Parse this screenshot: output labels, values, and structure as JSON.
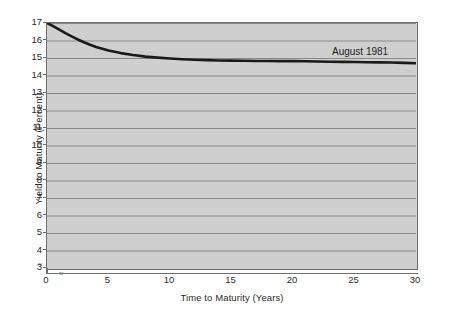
{
  "figure": {
    "background_color": "#ffffff",
    "plot_background_color": "#cfcfcf",
    "gridline_color": "#8a8a8a",
    "frame_color": "#6f6f6f",
    "curve_color": "#1a1a1a"
  },
  "axis_break": {
    "y_break_symbol": "≈",
    "x_break_symbol": "≈"
  },
  "chart_data": {
    "type": "line",
    "title": "",
    "subtitle": "",
    "xlabel": "Time to Maturity (Years)",
    "ylabel": "Yield to Maturity (Percent)",
    "xlim": [
      0,
      30
    ],
    "ylim": [
      3,
      17
    ],
    "y_axis_has_break_below": 3,
    "x_ticks": [
      0,
      5,
      10,
      15,
      20,
      25,
      30
    ],
    "x_tick_labels": [
      "0",
      "5",
      "10",
      "15",
      "20",
      "25",
      "30"
    ],
    "y_ticks": [
      3,
      4,
      5,
      6,
      7,
      8,
      9,
      10,
      11,
      12,
      13,
      14,
      15,
      16,
      17
    ],
    "y_tick_labels": [
      "3",
      "4",
      "5",
      "6",
      "7",
      "8",
      "9",
      "10",
      "11",
      "12",
      "13",
      "14",
      "15",
      "16",
      "17"
    ],
    "grid": true,
    "grid_axis": "y",
    "legend": false,
    "legend_position": "none",
    "annotations": [
      {
        "text": "August 1981",
        "x": 24.0,
        "y": 15.45
      }
    ],
    "series": [
      {
        "name": "August 1981",
        "color": "#1a1a1a",
        "x": [
          0,
          0.5,
          1,
          1.5,
          2,
          2.5,
          3,
          3.5,
          4,
          5,
          6,
          7,
          8,
          9,
          10,
          11,
          12,
          13,
          14,
          15,
          16,
          17,
          18,
          19,
          20,
          21,
          22,
          23,
          24,
          25,
          26,
          27,
          28,
          29,
          30
        ],
        "y": [
          17.0,
          16.82,
          16.62,
          16.42,
          16.24,
          16.06,
          15.9,
          15.76,
          15.63,
          15.43,
          15.28,
          15.17,
          15.08,
          15.02,
          14.97,
          14.93,
          14.9,
          14.88,
          14.86,
          14.85,
          14.84,
          14.83,
          14.83,
          14.82,
          14.82,
          14.81,
          14.8,
          14.79,
          14.78,
          14.77,
          14.76,
          14.75,
          14.74,
          14.72,
          14.7
        ]
      }
    ]
  }
}
